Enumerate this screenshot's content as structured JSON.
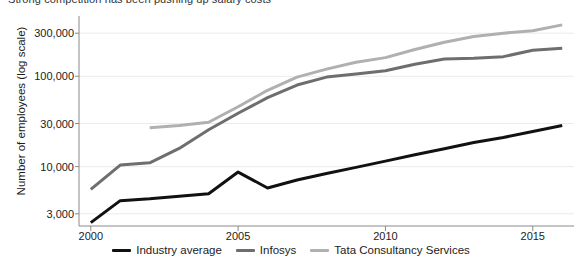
{
  "chart_data": {
    "type": "line",
    "title": "Strong competition has been pushing up salary costs",
    "xlabel": "",
    "ylabel": "Number of employees (log scale)",
    "yscale": "log",
    "ylim": [
      2200,
      420000
    ],
    "xlim": [
      1999.6,
      2016.4
    ],
    "grid": true,
    "grid_axis": "y",
    "legend_position": "bottom-center",
    "yticks": [
      3000,
      10000,
      30000,
      100000,
      300000
    ],
    "ytick_labels": [
      "3,000",
      "10,000",
      "30,000",
      "100,000",
      "300,000"
    ],
    "xticks": [
      2000,
      2005,
      2010,
      2015
    ],
    "xtick_labels": [
      "2000",
      "2005",
      "2010",
      "2015"
    ],
    "x": [
      2000,
      2001,
      2002,
      2003,
      2004,
      2005,
      2006,
      2007,
      2008,
      2009,
      2010,
      2011,
      2012,
      2013,
      2014,
      2015,
      2016
    ],
    "series": [
      {
        "name": "Industry average",
        "color": "#111111",
        "x": [
          2000,
          2001,
          2002,
          2003,
          2004,
          2005,
          2006,
          2007,
          2008,
          2009,
          2010,
          2011,
          2012,
          2013,
          2014,
          2015,
          2016
        ],
        "values": [
          2400,
          4200,
          4400,
          4700,
          5000,
          8700,
          5800,
          7100,
          8400,
          9800,
          11500,
          13500,
          15800,
          18500,
          21000,
          24500,
          28500
        ]
      },
      {
        "name": "Infosys",
        "color": "#6e6e6e",
        "x": [
          2000,
          2001,
          2002,
          2003,
          2004,
          2005,
          2006,
          2007,
          2008,
          2009,
          2010,
          2011,
          2012,
          2013,
          2014,
          2015,
          2016
        ],
        "values": [
          5600,
          10400,
          11000,
          15900,
          25600,
          39000,
          58000,
          80000,
          98000,
          106000,
          115000,
          136000,
          155000,
          158000,
          165000,
          194000,
          204000
        ]
      },
      {
        "name": "Tata Consultancy Services",
        "color": "#b0b0b0",
        "x": [
          2002,
          2003,
          2004,
          2005,
          2006,
          2007,
          2008,
          2009,
          2010,
          2011,
          2012,
          2013,
          2014,
          2015,
          2016
        ],
        "values": [
          27000,
          28500,
          31000,
          46000,
          70000,
          98000,
          120000,
          143000,
          161000,
          198000,
          238000,
          276000,
          300000,
          320000,
          371000
        ]
      }
    ]
  },
  "legend": {
    "items": [
      {
        "label": "Industry average",
        "color": "#111111"
      },
      {
        "label": "Infosys",
        "color": "#6e6e6e"
      },
      {
        "label": "Tata Consultancy Services",
        "color": "#b0b0b0"
      }
    ]
  }
}
